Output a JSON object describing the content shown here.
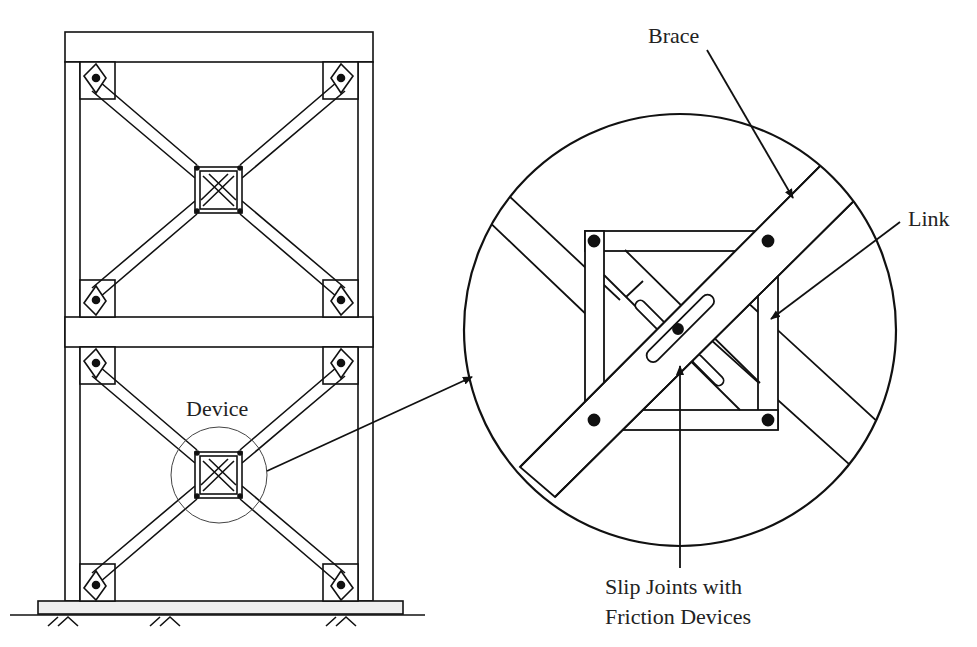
{
  "figure": {
    "type": "structural-diagram"
  },
  "labels": {
    "device": "Device",
    "brace": "Brace",
    "link": "Link",
    "slip_joints_line1": "Slip Joints with",
    "slip_joints_line2": "Friction Devices"
  },
  "colors": {
    "stroke": "#111111",
    "base_fill": "#eeeeee",
    "background": "#ffffff"
  }
}
